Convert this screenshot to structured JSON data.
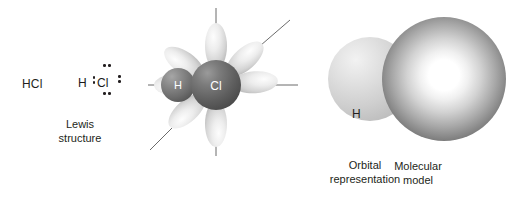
{
  "figure": {
    "background_color": "#ffffff"
  },
  "lewis_panel": {
    "formula": "HCl",
    "center_atom": "Cl",
    "bonded_atom": "H",
    "caption": "Lewis\nstructure",
    "bonding_pairs": 1,
    "lone_pairs": 3,
    "dot_groups": [
      {
        "name": "bonding-pair",
        "position": "between-h-and-cl",
        "orientation": "vertical",
        "dots": 2
      },
      {
        "name": "lone-pair-top",
        "position": "above-cl",
        "orientation": "horizontal",
        "dots": 2
      },
      {
        "name": "lone-pair-bottom",
        "position": "below-cl",
        "orientation": "horizontal",
        "dots": 2
      },
      {
        "name": "lone-pair-right",
        "position": "right-of-cl",
        "orientation": "vertical",
        "dots": 2
      }
    ]
  },
  "orbital_panel": {
    "caption": "Orbital\nrepresentation",
    "hydrogen_label": "H",
    "chlorine_label": "Cl",
    "lobe_count": 7,
    "axis_lines": 5,
    "sphere_color_h": "#6e6e6e",
    "sphere_color_cl": "#5a5a5a",
    "lobe_color": "#cfcfcf"
  },
  "model_panel": {
    "caption": "Molecular\nmodel",
    "hydrogen_label": "H",
    "chlorine_label": "Cl",
    "hydrogen_color": "#cfcfcf",
    "chlorine_color": "#606060"
  }
}
